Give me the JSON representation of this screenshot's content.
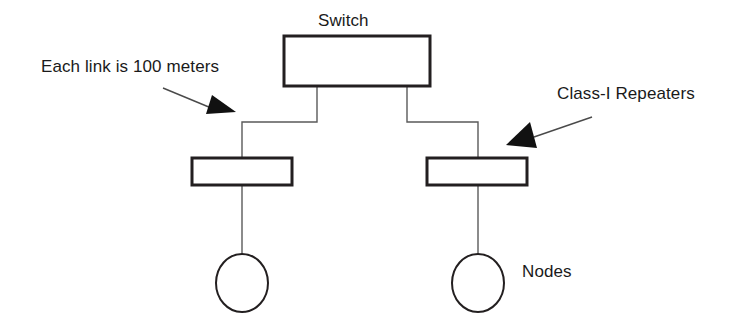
{
  "diagram": {
    "title_label": "Switch",
    "annotations": {
      "left_note": "Each link is 100 meters",
      "right_note": "Class-I Repeaters",
      "nodes_note": "Nodes"
    },
    "colors": {
      "background": "#ffffff",
      "stroke_heavy": "#231f20",
      "stroke_light": "#5a5a5a",
      "arrow_fill": "#111111",
      "text": "#1a1a1a"
    },
    "shapes": {
      "switch_box": {
        "x": 284,
        "y": 36,
        "width": 146,
        "height": 50,
        "stroke_width": 3
      },
      "repeater_left": {
        "x": 192,
        "y": 158,
        "width": 100,
        "height": 27,
        "stroke_width": 3
      },
      "repeater_right": {
        "x": 427,
        "y": 158,
        "width": 100,
        "height": 27,
        "stroke_width": 3
      },
      "node_left": {
        "cx": 242,
        "cy": 283,
        "rx": 26,
        "ry": 29,
        "stroke_width": 2
      },
      "node_right": {
        "cx": 478,
        "cy": 283,
        "rx": 26,
        "ry": 29,
        "stroke_width": 2
      }
    },
    "links": {
      "switch_to_left_repeater": "M 317 86 L 317 122 L 242 122 L 242 158",
      "switch_to_right_repeater": "M 407 86 L 407 122 L 478 122 L 478 158",
      "left_repeater_to_node": "M 242 185 L 242 254",
      "right_repeater_to_node": "M 478 185 L 478 254"
    },
    "arrows": {
      "left_leader_line": "M 163 88 L 216 110",
      "left_arrow_head": "212,95 236,112 206,114",
      "right_leader_line": "M 592 117 L 534 137",
      "right_arrow_head": "530,122 537,148 506,145"
    }
  }
}
